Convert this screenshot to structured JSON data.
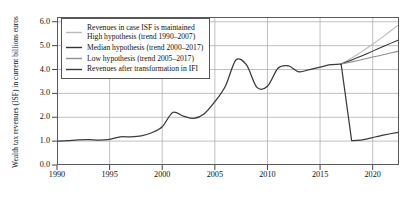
{
  "chart_data": {
    "type": "line",
    "title": "",
    "xlabel": "",
    "ylabel": "Wealth tax revenues (ISF) in current billions euros",
    "xlim": [
      1990,
      2022.5
    ],
    "ylim": [
      0.0,
      6.2
    ],
    "grid": true,
    "legend_position": "top-left",
    "yticks": [
      "0.0",
      "1.0",
      "2.0",
      "3.0",
      "4.0",
      "5.0",
      "6.0"
    ],
    "ytick_values": [
      0.0,
      1.0,
      2.0,
      3.0,
      4.0,
      5.0,
      6.0
    ],
    "xticks": [
      "1990",
      "1995",
      "2000",
      "2005",
      "2010",
      "2015",
      "2020"
    ],
    "xtick_values": [
      1990,
      1995,
      2000,
      2005,
      2010,
      2015,
      2020
    ],
    "colors": {
      "high": "#b9b9b9",
      "median": "#333333",
      "low": "#8f8f8f",
      "actual": "#3a3a3a"
    },
    "series": [
      {
        "name": "Revenues in case ISF is maintained High hypothesis (trend 1990–2007)",
        "key": "high",
        "color": "#b9b9b9",
        "x": [
          2017,
          2018,
          2019,
          2020,
          2021,
          2022.4
        ],
        "values": [
          4.23,
          4.48,
          4.76,
          5.06,
          5.38,
          5.85
        ]
      },
      {
        "name": "Median hypothesis (trend 2000–2017)",
        "key": "median",
        "color": "#333333",
        "x": [
          2017,
          2018,
          2019,
          2020,
          2021,
          2022.4
        ],
        "values": [
          4.23,
          4.4,
          4.58,
          4.77,
          4.96,
          5.23
        ]
      },
      {
        "name": "Low hypothesis (trend 2005–2017)",
        "key": "low",
        "color": "#8f8f8f",
        "x": [
          2017,
          2018,
          2019,
          2020,
          2021,
          2022.4
        ],
        "values": [
          4.23,
          4.32,
          4.42,
          4.52,
          4.62,
          4.76
        ]
      },
      {
        "name": "Revenues after transformation in IFI",
        "key": "actual",
        "color": "#3a3a3a",
        "x": [
          1990,
          1991,
          1992,
          1993,
          1994,
          1995,
          1996,
          1997,
          1998,
          1999,
          2000,
          2001,
          2002,
          2003,
          2004,
          2005,
          2006,
          2007,
          2008,
          2009,
          2010,
          2011,
          2012,
          2013,
          2014,
          2015,
          2016,
          2017,
          2018,
          2019,
          2020,
          2021,
          2022.4
        ],
        "values": [
          1.0,
          1.02,
          1.05,
          1.06,
          1.04,
          1.07,
          1.18,
          1.18,
          1.22,
          1.35,
          1.6,
          2.2,
          2.05,
          1.95,
          2.15,
          2.65,
          3.3,
          4.4,
          4.2,
          3.25,
          3.3,
          4.05,
          4.15,
          3.9,
          4.0,
          4.1,
          4.2,
          4.23,
          1.02,
          1.05,
          1.15,
          1.25,
          1.37
        ]
      }
    ]
  },
  "legend": {
    "entries": [
      {
        "label_line1": "Revenues in case ISF is maintained",
        "label_line2": "High hypothesis (trend 1990–2007)",
        "color": "#b9b9b9"
      },
      {
        "label_line1": "Median hypothesis (trend 2000–2017)",
        "label_line2": "",
        "color": "#333333"
      },
      {
        "label_line1": "Low hypothesis (trend 2005–2017)",
        "label_line2": "",
        "color": "#8f8f8f"
      },
      {
        "label_line1": "Revenues after transformation in IFI",
        "label_line2": "",
        "color": "#3a3a3a"
      }
    ]
  }
}
